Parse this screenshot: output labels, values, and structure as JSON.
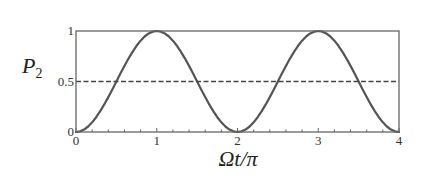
{
  "chart_data": {
    "type": "line",
    "title": "",
    "xlabel": "Ωt/π",
    "ylabel": "P₂",
    "ylabel_main": "P",
    "ylabel_sub": "2",
    "xlim": [
      0,
      4
    ],
    "ylim": [
      0,
      1
    ],
    "xticks": [
      0,
      1,
      2,
      3,
      4
    ],
    "xtick_labels": [
      "0",
      "1",
      "2",
      "3",
      "4"
    ],
    "x_minor_step": 0.2,
    "yticks": [
      0,
      0.5,
      1
    ],
    "ytick_labels": [
      "0",
      "0.5",
      "1"
    ],
    "grid": false,
    "legend": null,
    "series": [
      {
        "name": "P2",
        "style": "solid",
        "color": "#555555",
        "function": "sin^2(pi*x/2)",
        "x": [
          0,
          0.05,
          0.1,
          0.15,
          0.2,
          0.25,
          0.3,
          0.35,
          0.4,
          0.45,
          0.5,
          0.55,
          0.6,
          0.65,
          0.7,
          0.75,
          0.8,
          0.85,
          0.9,
          0.95,
          1,
          1.05,
          1.1,
          1.15,
          1.2,
          1.25,
          1.3,
          1.35,
          1.4,
          1.45,
          1.5,
          1.55,
          1.6,
          1.65,
          1.7,
          1.75,
          1.8,
          1.85,
          1.9,
          1.95,
          2,
          2.05,
          2.1,
          2.15,
          2.2,
          2.25,
          2.3,
          2.35,
          2.4,
          2.45,
          2.5,
          2.55,
          2.6,
          2.65,
          2.7,
          2.75,
          2.8,
          2.85,
          2.9,
          2.95,
          3,
          3.05,
          3.1,
          3.15,
          3.2,
          3.25,
          3.3,
          3.35,
          3.4,
          3.45,
          3.5,
          3.55,
          3.6,
          3.65,
          3.7,
          3.75,
          3.8,
          3.85,
          3.9,
          3.95,
          4
        ],
        "values": [
          0,
          0.0062,
          0.0245,
          0.0545,
          0.0955,
          0.1464,
          0.2061,
          0.273,
          0.3455,
          0.4218,
          0.5,
          0.5782,
          0.6545,
          0.727,
          0.7939,
          0.8536,
          0.9045,
          0.9455,
          0.9755,
          0.9938,
          1,
          0.9938,
          0.9755,
          0.9455,
          0.9045,
          0.8536,
          0.7939,
          0.727,
          0.6545,
          0.5782,
          0.5,
          0.4218,
          0.3455,
          0.273,
          0.2061,
          0.1464,
          0.0955,
          0.0545,
          0.0245,
          0.0062,
          0,
          0.0062,
          0.0245,
          0.0545,
          0.0955,
          0.1464,
          0.2061,
          0.273,
          0.3455,
          0.4218,
          0.5,
          0.5782,
          0.6545,
          0.727,
          0.7939,
          0.8536,
          0.9045,
          0.9455,
          0.9755,
          0.9938,
          1,
          0.9938,
          0.9755,
          0.9455,
          0.9045,
          0.8536,
          0.7939,
          0.727,
          0.6545,
          0.5782,
          0.5,
          0.4218,
          0.3455,
          0.273,
          0.2061,
          0.1464,
          0.0955,
          0.0545,
          0.0245,
          0.0062,
          0
        ]
      },
      {
        "name": "reference 0.5",
        "style": "dashed",
        "color": "#444444",
        "x": [
          0,
          4
        ],
        "values": [
          0.5,
          0.5
        ]
      }
    ],
    "colors": {
      "frame": "#666666",
      "curve": "#555555",
      "dashed": "#444444",
      "text": "#333333"
    }
  }
}
